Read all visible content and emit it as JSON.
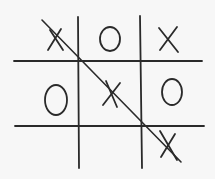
{
  "game": {
    "name": "Tic-Tac-Toe",
    "board": [
      [
        "X",
        "O",
        "X"
      ],
      [
        "O",
        "X",
        "O"
      ],
      [
        "",
        "",
        "X"
      ]
    ],
    "winner": "X",
    "winning_line": "diagonal-top-left-to-bottom-right",
    "colors": {
      "ink": "#2a2a2a",
      "paper": "#f7f7f7"
    }
  }
}
